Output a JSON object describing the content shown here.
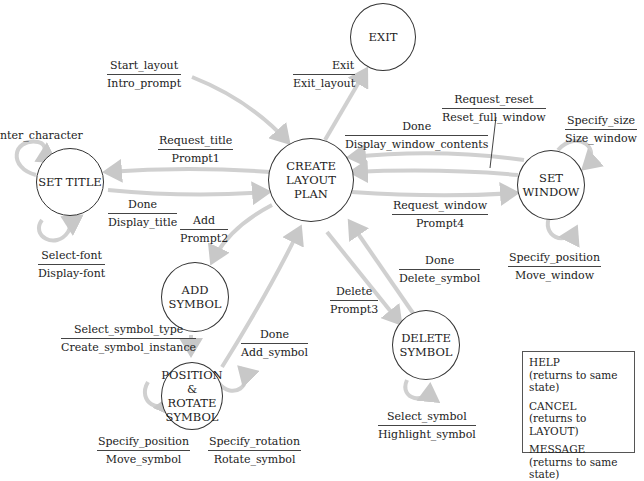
{
  "states": {
    "exit": "EXIT",
    "create_layout": [
      "CREATE",
      "LAYOUT",
      "PLAN"
    ],
    "set_title": "SET TITLE",
    "set_window": [
      "SET",
      "WINDOW"
    ],
    "add_symbol": [
      "ADD",
      "SYMBOL"
    ],
    "position_rotate": [
      "POSITION",
      "& ROTATE",
      "SYMBOL"
    ],
    "delete_symbol": [
      "DELETE",
      "SYMBOL"
    ]
  },
  "transitions": {
    "start_layout": {
      "event": "Start_layout",
      "action": "Intro_prompt"
    },
    "exit": {
      "event": "Exit",
      "action": "Exit_layout"
    },
    "request_title": {
      "event": "Request_title",
      "action": "Prompt1"
    },
    "done_title": {
      "event": "Done",
      "action": "Display_title"
    },
    "enter_character": {
      "event": "nter_character",
      "action": ""
    },
    "select_font": {
      "event": "Select-font",
      "action": "Display-font"
    },
    "add": {
      "event": "Add",
      "action": "Prompt2"
    },
    "request_reset": {
      "event": "Request_reset",
      "action": "Reset_full_window"
    },
    "done_window": {
      "event": "Done",
      "action": "Display_window_contents"
    },
    "request_window": {
      "event": "Request_window",
      "action": "Prompt4"
    },
    "specify_size": {
      "event": "Specify_size",
      "action": "Size_window"
    },
    "specify_position_window": {
      "event": "Specify_position",
      "action": "Move_window"
    },
    "delete": {
      "event": "Delete",
      "action": "Prompt3"
    },
    "done_delete": {
      "event": "Done",
      "action": "Delete_symbol"
    },
    "select_symbol_type": {
      "event": "Select_symbol_type",
      "action": "Create_symbol_instance"
    },
    "done_add": {
      "event": "Done",
      "action": "Add_symbol"
    },
    "specify_position_symbol": {
      "event": "Specify_position",
      "action": "Move_symbol"
    },
    "specify_rotation": {
      "event": "Specify_rotation",
      "action": "Rotate_symbol"
    },
    "select_symbol": {
      "event": "Select_symbol",
      "action": "Highlight_symbol"
    }
  },
  "legend": [
    {
      "name": "HELP",
      "note": "(returns to same state)"
    },
    {
      "name": "CANCEL",
      "note": "(returns to LAYOUT)"
    },
    {
      "name": "MESSAGE",
      "note": "(returns to same state)"
    }
  ],
  "colors": {
    "arrow": "#cfcfcf",
    "outline": "#333333"
  }
}
